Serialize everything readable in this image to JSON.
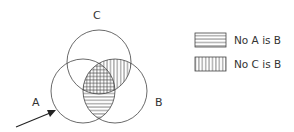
{
  "diagram": {
    "type": "venn",
    "sets": [
      {
        "id": "A",
        "label": "A"
      },
      {
        "id": "B",
        "label": "B"
      },
      {
        "id": "C",
        "label": "C"
      }
    ],
    "shading": [
      {
        "region": "A∩B",
        "pattern": "horizontal-lines",
        "meaning": "No A is B"
      },
      {
        "region": "C∩B",
        "pattern": "vertical-lines",
        "meaning": "No C is B"
      }
    ],
    "arrow_target": "A"
  },
  "labels": {
    "a": "A",
    "b": "B",
    "c": "C"
  },
  "legend": {
    "items": [
      {
        "pattern": "horizontal-lines",
        "label": "No A is B"
      },
      {
        "pattern": "vertical-lines",
        "label": "No C is B"
      }
    ]
  },
  "colors": {
    "stroke": "#444444",
    "text": "#333333"
  }
}
